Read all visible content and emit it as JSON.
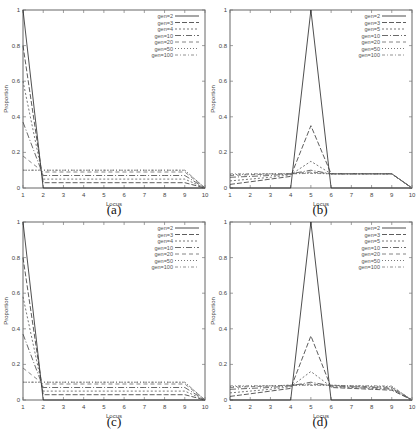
{
  "figure": {
    "captions": [
      "(a)",
      "(b)",
      "(c)",
      "(d)"
    ]
  },
  "chart_data": [
    {
      "id": "a",
      "type": "line",
      "title": "",
      "caption": "(a)",
      "xlabel": "Locus",
      "ylabel": "Proportion",
      "x": [
        1,
        2,
        3,
        4,
        5,
        6,
        7,
        8,
        9,
        10
      ],
      "xlim": [
        1,
        10
      ],
      "ylim": [
        0,
        1
      ],
      "xticks": [
        "1",
        "2",
        "3",
        "4",
        "5",
        "6",
        "7",
        "8",
        "9",
        "10"
      ],
      "yticks": [
        "0",
        "0.2",
        "0.4",
        "0.6",
        "0.8",
        "1"
      ],
      "grid": false,
      "legend_position": "top-right",
      "series": [
        {
          "name": "gen=2",
          "values": [
            1.0,
            0.0,
            0.0,
            0.0,
            0.0,
            0.0,
            0.0,
            0.0,
            0.0,
            0.0
          ],
          "dash": ""
        },
        {
          "name": "gen=3",
          "values": [
            0.8,
            0.03,
            0.03,
            0.03,
            0.03,
            0.03,
            0.03,
            0.03,
            0.03,
            0.0
          ],
          "dash": "5,2"
        },
        {
          "name": "gen=4",
          "values": [
            0.6,
            0.05,
            0.05,
            0.05,
            0.05,
            0.05,
            0.05,
            0.05,
            0.05,
            0.0
          ],
          "dash": "2,2"
        },
        {
          "name": "gen=10",
          "values": [
            0.37,
            0.07,
            0.07,
            0.07,
            0.07,
            0.07,
            0.07,
            0.07,
            0.07,
            0.0
          ],
          "dash": "6,2,1,2"
        },
        {
          "name": "gen=20",
          "values": [
            0.18,
            0.09,
            0.09,
            0.09,
            0.09,
            0.09,
            0.09,
            0.09,
            0.09,
            0.0
          ],
          "dash": "4,3"
        },
        {
          "name": "gen=50",
          "values": [
            0.1,
            0.1,
            0.1,
            0.1,
            0.1,
            0.1,
            0.1,
            0.1,
            0.1,
            0.0
          ],
          "dash": "1,2"
        },
        {
          "name": "gen=100",
          "values": [
            0.1,
            0.1,
            0.1,
            0.1,
            0.1,
            0.1,
            0.1,
            0.1,
            0.1,
            0.0
          ],
          "dash": "3,2,1,2"
        }
      ]
    },
    {
      "id": "b",
      "type": "line",
      "title": "",
      "caption": "(b)",
      "xlabel": "Locus",
      "ylabel": "Proportion",
      "x": [
        1,
        2,
        3,
        4,
        5,
        6,
        7,
        8,
        9,
        10
      ],
      "xlim": [
        1,
        10
      ],
      "ylim": [
        0,
        1
      ],
      "xticks": [
        "1",
        "2",
        "3",
        "4",
        "5",
        "6",
        "7",
        "8",
        "9",
        "10"
      ],
      "yticks": [
        "0",
        "0.2",
        "0.4",
        "0.6",
        "0.8",
        "1"
      ],
      "grid": false,
      "legend_position": "top-right",
      "series": [
        {
          "name": "gen=2",
          "values": [
            0.0,
            0.0,
            0.0,
            0.0,
            1.0,
            0.0,
            0.0,
            0.0,
            0.0,
            0.0
          ],
          "dash": ""
        },
        {
          "name": "gen=3",
          "values": [
            0.02,
            0.035,
            0.05,
            0.065,
            0.35,
            0.08,
            0.08,
            0.08,
            0.08,
            0.0
          ],
          "dash": "5,2"
        },
        {
          "name": "gen=5",
          "values": [
            0.04,
            0.05,
            0.06,
            0.075,
            0.15,
            0.08,
            0.08,
            0.08,
            0.08,
            0.0
          ],
          "dash": "2,2"
        },
        {
          "name": "gen=10",
          "values": [
            0.06,
            0.065,
            0.07,
            0.08,
            0.1,
            0.08,
            0.08,
            0.08,
            0.08,
            0.0
          ],
          "dash": "6,2,1,2"
        },
        {
          "name": "gen=20",
          "values": [
            0.07,
            0.075,
            0.078,
            0.08,
            0.09,
            0.08,
            0.08,
            0.08,
            0.08,
            0.0
          ],
          "dash": "4,3"
        },
        {
          "name": "gen=50",
          "values": [
            0.075,
            0.078,
            0.08,
            0.08,
            0.085,
            0.08,
            0.08,
            0.08,
            0.08,
            0.0
          ],
          "dash": "1,2"
        },
        {
          "name": "gen=100",
          "values": [
            0.08,
            0.08,
            0.08,
            0.08,
            0.082,
            0.08,
            0.08,
            0.08,
            0.08,
            0.0
          ],
          "dash": "3,2,1,2"
        }
      ]
    },
    {
      "id": "c",
      "type": "line",
      "title": "",
      "caption": "(c)",
      "xlabel": "Locus",
      "ylabel": "Proportion",
      "x": [
        1,
        2,
        3,
        4,
        5,
        6,
        7,
        8,
        9,
        10
      ],
      "xlim": [
        1,
        10
      ],
      "ylim": [
        0,
        1
      ],
      "xticks": [
        "1",
        "2",
        "3",
        "4",
        "5",
        "6",
        "7",
        "8",
        "9",
        "10"
      ],
      "yticks": [
        "0",
        "0.2",
        "0.4",
        "0.6",
        "0.8",
        "1"
      ],
      "grid": false,
      "legend_position": "top-right",
      "series": [
        {
          "name": "gen=2",
          "values": [
            1.0,
            0.0,
            0.0,
            0.0,
            0.0,
            0.0,
            0.0,
            0.0,
            0.0,
            0.0
          ],
          "dash": ""
        },
        {
          "name": "gen=3",
          "values": [
            0.8,
            0.03,
            0.03,
            0.03,
            0.03,
            0.03,
            0.03,
            0.03,
            0.03,
            0.0
          ],
          "dash": "5,2"
        },
        {
          "name": "gen=4",
          "values": [
            0.58,
            0.05,
            0.05,
            0.05,
            0.05,
            0.05,
            0.05,
            0.05,
            0.05,
            0.0
          ],
          "dash": "2,2"
        },
        {
          "name": "gen=10",
          "values": [
            0.37,
            0.07,
            0.07,
            0.07,
            0.07,
            0.07,
            0.07,
            0.07,
            0.07,
            0.0
          ],
          "dash": "6,2,1,2"
        },
        {
          "name": "gen=20",
          "values": [
            0.18,
            0.09,
            0.09,
            0.09,
            0.09,
            0.09,
            0.09,
            0.09,
            0.09,
            0.0
          ],
          "dash": "4,3"
        },
        {
          "name": "gen=50",
          "values": [
            0.1,
            0.1,
            0.1,
            0.1,
            0.1,
            0.1,
            0.1,
            0.1,
            0.1,
            0.0
          ],
          "dash": "1,2"
        },
        {
          "name": "gen=100",
          "values": [
            0.1,
            0.1,
            0.1,
            0.1,
            0.1,
            0.1,
            0.1,
            0.1,
            0.1,
            0.0
          ],
          "dash": "3,2,1,2"
        }
      ]
    },
    {
      "id": "d",
      "type": "line",
      "title": "",
      "caption": "(d)",
      "xlabel": "Locus",
      "ylabel": "Proportion",
      "x": [
        1,
        2,
        3,
        4,
        5,
        6,
        7,
        8,
        9,
        10
      ],
      "xlim": [
        1,
        10
      ],
      "ylim": [
        0,
        1
      ],
      "xticks": [
        "1",
        "2",
        "3",
        "4",
        "5",
        "6",
        "7",
        "8",
        "9",
        "10"
      ],
      "yticks": [
        "0",
        "0.2",
        "0.4",
        "0.6",
        "0.8",
        "1"
      ],
      "grid": false,
      "legend_position": "top-right",
      "series": [
        {
          "name": "gen=2",
          "values": [
            0.0,
            0.0,
            0.0,
            0.0,
            1.0,
            0.0,
            0.0,
            0.0,
            0.0,
            0.0
          ],
          "dash": ""
        },
        {
          "name": "gen=3",
          "values": [
            0.02,
            0.035,
            0.05,
            0.065,
            0.36,
            0.07,
            0.065,
            0.06,
            0.055,
            0.0
          ],
          "dash": "5,2"
        },
        {
          "name": "gen=5",
          "values": [
            0.04,
            0.05,
            0.06,
            0.075,
            0.16,
            0.075,
            0.07,
            0.065,
            0.06,
            0.0
          ],
          "dash": "2,2"
        },
        {
          "name": "gen=10",
          "values": [
            0.06,
            0.065,
            0.07,
            0.08,
            0.1,
            0.08,
            0.075,
            0.07,
            0.065,
            0.0
          ],
          "dash": "6,2,1,2"
        },
        {
          "name": "gen=20",
          "values": [
            0.07,
            0.075,
            0.078,
            0.082,
            0.09,
            0.082,
            0.078,
            0.075,
            0.07,
            0.0
          ],
          "dash": "4,3"
        },
        {
          "name": "gen=50",
          "values": [
            0.075,
            0.078,
            0.08,
            0.083,
            0.085,
            0.083,
            0.08,
            0.078,
            0.075,
            0.0
          ],
          "dash": "1,2"
        },
        {
          "name": "gen=100",
          "values": [
            0.08,
            0.08,
            0.08,
            0.083,
            0.082,
            0.083,
            0.08,
            0.08,
            0.078,
            0.0
          ],
          "dash": "3,2,1,2"
        }
      ]
    }
  ]
}
